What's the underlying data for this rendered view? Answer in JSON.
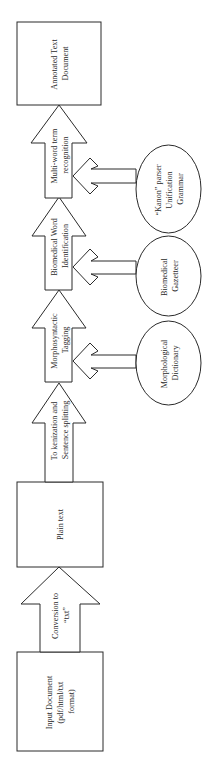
{
  "diagram": {
    "orientation": "rotated -90deg (flow runs bottom to top)",
    "colors": {
      "stroke": "#2a2a2a",
      "fill": "#ffffff",
      "text": "#2a2a2a"
    },
    "boxes": [
      {
        "id": "input",
        "lines": [
          "Input Document",
          "(pdf/html/txt",
          "format)"
        ]
      },
      {
        "id": "plain",
        "lines": [
          "Plain text"
        ]
      },
      {
        "id": "annotated",
        "lines": [
          "Annotated Text",
          "Document"
        ]
      }
    ],
    "process_arrows": [
      {
        "id": "conversion",
        "lines": [
          "Conversion to",
          "“txt”"
        ]
      },
      {
        "id": "tokenization",
        "lines": [
          "To kenization and",
          "Sentence splitting"
        ]
      },
      {
        "id": "morpho",
        "lines": [
          "Morphosyntactic",
          "Tagging"
        ]
      },
      {
        "id": "biomed",
        "lines": [
          "Biomedical Word",
          "Identification"
        ]
      },
      {
        "id": "multiword",
        "lines": [
          "Multi-word term",
          "recognition"
        ]
      }
    ],
    "resources": [
      {
        "id": "dictionary",
        "lines": [
          "Morphological",
          "Dictionary"
        ],
        "feeds": "morpho"
      },
      {
        "id": "gazetteer",
        "lines": [
          "Biomedical",
          "Gazetteer"
        ],
        "feeds": "biomed"
      },
      {
        "id": "kanon",
        "lines": [
          "“Kanon” parser",
          "Unification",
          "Grammar"
        ],
        "feeds": "multiword"
      }
    ]
  }
}
